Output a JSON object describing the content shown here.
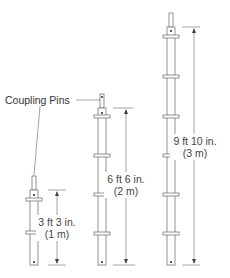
{
  "diagram": {
    "callout_label": "Coupling Pins",
    "poles": [
      {
        "id": "short",
        "height_ft": "3 ft 3 in.",
        "height_m": "(1 m)"
      },
      {
        "id": "medium",
        "height_ft": "6 ft 6 in.",
        "height_m": "(2 m)"
      },
      {
        "id": "tall",
        "height_ft": "9 ft 10 in.",
        "height_m": "(3 m)"
      }
    ],
    "colors": {
      "line": "#666666",
      "fill": "#ffffff"
    }
  }
}
